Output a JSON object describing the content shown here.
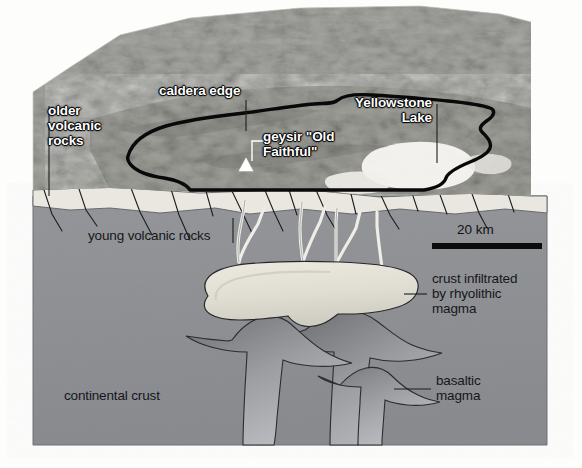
{
  "figure": {
    "scale_bar": {
      "label": "20 km"
    },
    "colors": {
      "continental_crust": "#8e9094",
      "young_volcanic_rocks": "#e9e7e0",
      "rhyolithic_magma": "#e2e0d6",
      "basaltic_magma": "#a9abaf",
      "caldera_outline": "#0b0b0c",
      "label_dark": "#16171a",
      "label_light": "#ffffff"
    }
  },
  "map_labels": {
    "older_volcanic_rocks": "older\nvolcanic\nrocks",
    "caldera_edge": "caldera edge",
    "yellowstone_lake": "Yellowstone\nLake",
    "geysir_old_faithful": "geysir \"Old\nFaithful\""
  },
  "section_labels": {
    "young_volcanic_rocks": "young volcanic rocks",
    "crust_infiltrated": "crust infiltrated\nby rhyolithic\nmagma",
    "basaltic_magma": "basaltic\nmagma",
    "continental_crust": "continental crust"
  },
  "markers": {
    "old_faithful_symbol": "triangle-marker"
  }
}
